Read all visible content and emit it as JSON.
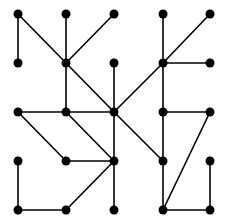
{
  "diagram": {
    "type": "graph",
    "grid": {
      "cols": 5,
      "rows": 5,
      "x": [
        18,
        66,
        114,
        163,
        210
      ],
      "y": [
        14,
        63,
        112,
        161,
        210
      ]
    },
    "node_color": "#000000",
    "edge_color": "#000000",
    "nodes": [
      [
        0,
        0
      ],
      [
        1,
        0
      ],
      [
        2,
        0
      ],
      [
        3,
        0
      ],
      [
        4,
        0
      ],
      [
        0,
        1
      ],
      [
        1,
        1
      ],
      [
        2,
        1
      ],
      [
        3,
        1
      ],
      [
        4,
        1
      ],
      [
        0,
        2
      ],
      [
        1,
        2
      ],
      [
        2,
        2
      ],
      [
        3,
        2
      ],
      [
        4,
        2
      ],
      [
        0,
        3
      ],
      [
        1,
        3
      ],
      [
        2,
        3
      ],
      [
        3,
        3
      ],
      [
        4,
        3
      ],
      [
        0,
        4
      ],
      [
        1,
        4
      ],
      [
        2,
        4
      ],
      [
        3,
        4
      ],
      [
        4,
        4
      ]
    ],
    "edges": [
      [
        [
          0,
          0
        ],
        [
          0,
          1
        ]
      ],
      [
        [
          0,
          0
        ],
        [
          1,
          1
        ]
      ],
      [
        [
          1,
          0
        ],
        [
          1,
          1
        ]
      ],
      [
        [
          2,
          0
        ],
        [
          1,
          1
        ]
      ],
      [
        [
          1,
          1
        ],
        [
          1,
          2
        ]
      ],
      [
        [
          1,
          1
        ],
        [
          2,
          2
        ]
      ],
      [
        [
          2,
          1
        ],
        [
          2,
          2
        ]
      ],
      [
        [
          3,
          0
        ],
        [
          3,
          1
        ]
      ],
      [
        [
          4,
          0
        ],
        [
          3,
          1
        ]
      ],
      [
        [
          3,
          1
        ],
        [
          4,
          1
        ]
      ],
      [
        [
          3,
          1
        ],
        [
          2,
          2
        ]
      ],
      [
        [
          3,
          1
        ],
        [
          3,
          2
        ]
      ],
      [
        [
          0,
          2
        ],
        [
          1,
          2
        ]
      ],
      [
        [
          1,
          2
        ],
        [
          2,
          2
        ]
      ],
      [
        [
          0,
          2
        ],
        [
          1,
          3
        ]
      ],
      [
        [
          1,
          2
        ],
        [
          2,
          3
        ]
      ],
      [
        [
          1,
          3
        ],
        [
          2,
          3
        ]
      ],
      [
        [
          2,
          2
        ],
        [
          2,
          3
        ]
      ],
      [
        [
          2,
          2
        ],
        [
          3,
          3
        ]
      ],
      [
        [
          2,
          3
        ],
        [
          2,
          4
        ]
      ],
      [
        [
          2,
          3
        ],
        [
          1,
          4
        ]
      ],
      [
        [
          0,
          3
        ],
        [
          0,
          4
        ]
      ],
      [
        [
          0,
          4
        ],
        [
          1,
          4
        ]
      ],
      [
        [
          3,
          2
        ],
        [
          4,
          2
        ]
      ],
      [
        [
          3,
          2
        ],
        [
          3,
          3
        ]
      ],
      [
        [
          3,
          3
        ],
        [
          3,
          4
        ]
      ],
      [
        [
          4,
          2
        ],
        [
          3,
          4
        ]
      ],
      [
        [
          3,
          4
        ],
        [
          4,
          4
        ]
      ],
      [
        [
          4,
          3
        ],
        [
          4,
          4
        ]
      ]
    ]
  }
}
